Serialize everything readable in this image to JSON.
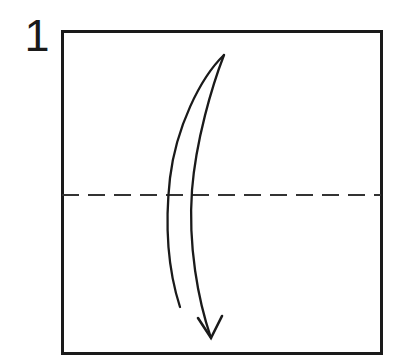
{
  "figure": {
    "kind": "origami-instruction-diagram",
    "step_label": "1",
    "background_color": "#ffffff",
    "ink_color": "#1a1a1a"
  },
  "paper": {
    "name": "square-sheet",
    "stroke_color": "#1a1a1a",
    "stroke_width": 3,
    "fill_color": "#ffffff",
    "left": 62,
    "top": 31,
    "right": 381,
    "bottom": 353,
    "width": 319,
    "height": 322
  },
  "crease_line": {
    "name": "horizontal-valley-fold-crease",
    "style": "dashed",
    "stroke_color": "#333333",
    "stroke_width": 2.2,
    "dash_length": 17,
    "gap_length": 9,
    "y": 195,
    "x_start": 62,
    "x_end": 381
  },
  "fold_arrow": {
    "name": "curved-fold-arrow",
    "direction": "downward",
    "stroke_color": "#1a1a1a",
    "stroke_width": 2.4,
    "tip_top": {
      "x": 224,
      "y": 55
    },
    "tip_bottom": {
      "x": 211,
      "y": 338
    },
    "left_stroke_end": {
      "x": 180,
      "y": 307
    },
    "arrowhead_left_wing": {
      "x": 198,
      "y": 318
    },
    "arrowhead_right_wing": {
      "x": 222,
      "y": 316
    },
    "paths": {
      "left_curve": "M224,55 C200,78 176,128 170,178 C164,232 170,276 180,307",
      "right_curve": "M224,55 C212,86 196,140 192,190 C188,246 198,300 211,338",
      "arrowhead": "M198,318 L211,338 L222,316"
    }
  }
}
